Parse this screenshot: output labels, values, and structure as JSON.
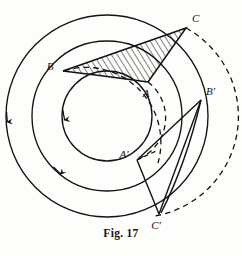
{
  "figure": {
    "caption": "Fig. 17",
    "caption_x": 121,
    "caption_y": 233,
    "background_color": "#fdfdfb",
    "ink_color": "#121212"
  },
  "geometry": {
    "center": {
      "x": 107,
      "y": 116
    },
    "circles": [
      {
        "name": "outer-circle",
        "radius": 101,
        "style": "solid",
        "arrow_angle_deg": 172
      },
      {
        "name": "middle-circle",
        "radius": 75,
        "style": "solid",
        "arrow_angle_deg": 150
      },
      {
        "name": "inner-circle",
        "radius": 45,
        "style": "solid",
        "arrow_angle_deg": 196
      }
    ],
    "dashed_arcs": [
      {
        "name": "outer-dashed-arc",
        "radius": 101,
        "start_deg": -62,
        "end_deg": 78
      },
      {
        "name": "middle-dashed-arc",
        "radius": 75,
        "start_deg": -47,
        "end_deg": 124
      },
      {
        "name": "inner-dashed-arc",
        "radius": 45,
        "start_deg": -55,
        "end_deg": 58
      }
    ]
  },
  "points": {
    "A": {
      "label": "A",
      "x": 148,
      "y": 82,
      "label_x": 144,
      "label_y": 96,
      "on": "inner-circle"
    },
    "B": {
      "label": "B",
      "x": 63,
      "y": 71,
      "label_x": 50,
      "label_y": 70,
      "on": "middle-circle"
    },
    "C": {
      "label": "C",
      "x": 186,
      "y": 28,
      "label_x": 191,
      "label_y": 22,
      "on": "outer-circle"
    },
    "Ap": {
      "label": "A′",
      "x": 137,
      "y": 160,
      "label_x": 124,
      "label_y": 157,
      "on": "inner-circle"
    },
    "Bp": {
      "label": "B′",
      "x": 201,
      "y": 100,
      "label_x": 206,
      "label_y": 95,
      "on": "middle-circle"
    },
    "Cp": {
      "label": "C′",
      "x": 159,
      "y": 214,
      "label_x": 155,
      "label_y": 228,
      "on": "outer-circle"
    }
  },
  "shapes": {
    "triangle_ABC": {
      "name": "hatched-triangle-ABC",
      "vertices": [
        "B",
        "C",
        "A"
      ],
      "fill": "hatched",
      "hatch_angle_deg": 60,
      "hatch_color": "#1a1a1a"
    },
    "triangle_ApBpCp": {
      "name": "triangle-A-prime-B-prime-C-prime",
      "vertices": [
        "Ap",
        "Bp",
        "Cp"
      ],
      "fill": "none"
    }
  },
  "arcs_between_primes": [
    {
      "name": "arc-Bp-to-Cp",
      "from": "Bp",
      "to": "Cp",
      "style": "solid"
    }
  ]
}
